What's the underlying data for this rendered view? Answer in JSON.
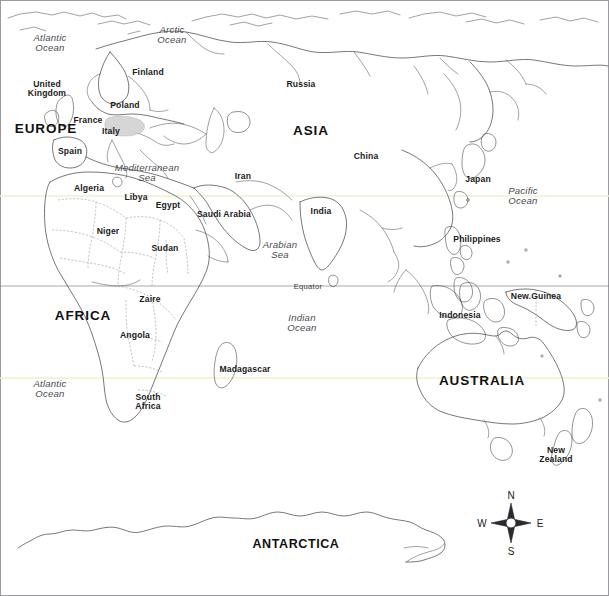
{
  "map": {
    "title": "World Outline Map",
    "background_color": "#ffffff",
    "outline_color": "#3d3d42",
    "border_color": "#7a7a80",
    "equator_color": "#6e6e74",
    "tropic_color": "#f2efd2",
    "highlight_color": "#c9c9c9"
  },
  "gridlines": [
    {
      "name": "equator",
      "label": "Equator",
      "label_x": 308,
      "label_y": 287,
      "y": 286,
      "x1": 0,
      "x2": 609
    },
    {
      "name": "tropic-of-capricorn",
      "label": "",
      "label_x": 0,
      "label_y": 0,
      "y": 378,
      "x1": 0,
      "x2": 609
    }
  ],
  "continents": [
    {
      "name": "europe",
      "label": "EUROPE",
      "x": 46,
      "y": 129,
      "size": "normal"
    },
    {
      "name": "asia",
      "label": "ASIA",
      "x": 311,
      "y": 131,
      "size": "normal"
    },
    {
      "name": "africa",
      "label": "AFRICA",
      "x": 83,
      "y": 316,
      "size": "normal"
    },
    {
      "name": "australia",
      "label": "AUSTRALIA",
      "x": 482,
      "y": 381,
      "size": "normal"
    },
    {
      "name": "antarctica",
      "label": "ANTARCTICA",
      "x": 296,
      "y": 545,
      "size": "small"
    }
  ],
  "countries": [
    {
      "name": "united-kingdom",
      "label": "United\nKingdom",
      "x": 47,
      "y": 89
    },
    {
      "name": "finland",
      "label": "Finland",
      "x": 148,
      "y": 73
    },
    {
      "name": "poland",
      "label": "Poland",
      "x": 125,
      "y": 106
    },
    {
      "name": "france",
      "label": "France",
      "x": 88,
      "y": 121
    },
    {
      "name": "italy",
      "label": "Italy",
      "x": 111,
      "y": 132
    },
    {
      "name": "spain",
      "label": "Spain",
      "x": 70,
      "y": 152
    },
    {
      "name": "russia",
      "label": "Russia",
      "x": 301,
      "y": 85
    },
    {
      "name": "china",
      "label": "China",
      "x": 366,
      "y": 157
    },
    {
      "name": "japan",
      "label": "Japan",
      "x": 478,
      "y": 180
    },
    {
      "name": "iran",
      "label": "Iran",
      "x": 243,
      "y": 177
    },
    {
      "name": "india",
      "label": "India",
      "x": 321,
      "y": 212
    },
    {
      "name": "saudi-arabia",
      "label": "Saudi Arabia",
      "x": 224,
      "y": 215
    },
    {
      "name": "philippines",
      "label": "Philippines",
      "x": 477,
      "y": 240
    },
    {
      "name": "indonesia",
      "label": "Indonesia",
      "x": 460,
      "y": 316
    },
    {
      "name": "new-guinea",
      "label": "New.Guinea",
      "x": 536,
      "y": 297
    },
    {
      "name": "algeria",
      "label": "Algeria",
      "x": 89,
      "y": 189
    },
    {
      "name": "libya",
      "label": "Libya",
      "x": 136,
      "y": 198
    },
    {
      "name": "egypt",
      "label": "Egypt",
      "x": 168,
      "y": 206
    },
    {
      "name": "niger",
      "label": "Niger",
      "x": 108,
      "y": 232
    },
    {
      "name": "sudan",
      "label": "Sudan",
      "x": 165,
      "y": 249
    },
    {
      "name": "zaire",
      "label": "Zaire",
      "x": 150,
      "y": 300
    },
    {
      "name": "angola",
      "label": "Angola",
      "x": 135,
      "y": 336
    },
    {
      "name": "south-africa",
      "label": "South\nAfrica",
      "x": 148,
      "y": 402
    },
    {
      "name": "madagascar",
      "label": "Madagascar",
      "x": 245,
      "y": 370
    },
    {
      "name": "new-zealand",
      "label": "New\nZealand",
      "x": 556,
      "y": 455
    }
  ],
  "waters": [
    {
      "name": "atlantic-ocean-north",
      "label": "Atlantic\nOcean",
      "x": 50,
      "y": 43
    },
    {
      "name": "arctic-ocean",
      "label": "Arctic\nOcean",
      "x": 172,
      "y": 35
    },
    {
      "name": "mediterranean-sea",
      "label": "Mediterranean\nSea",
      "x": 147,
      "y": 173
    },
    {
      "name": "arabian-sea",
      "label": "Arabian\nSea",
      "x": 280,
      "y": 250
    },
    {
      "name": "indian-ocean",
      "label": "Indian\nOcean",
      "x": 302,
      "y": 323
    },
    {
      "name": "atlantic-ocean-south",
      "label": "Atlantic\nOcean",
      "x": 50,
      "y": 389
    },
    {
      "name": "pacific-ocean",
      "label": "Pacific\nOcean",
      "x": 523,
      "y": 196
    }
  ],
  "compass": {
    "name": "compass-rose",
    "north": "N",
    "south": "S",
    "east": "E",
    "west": "W"
  }
}
